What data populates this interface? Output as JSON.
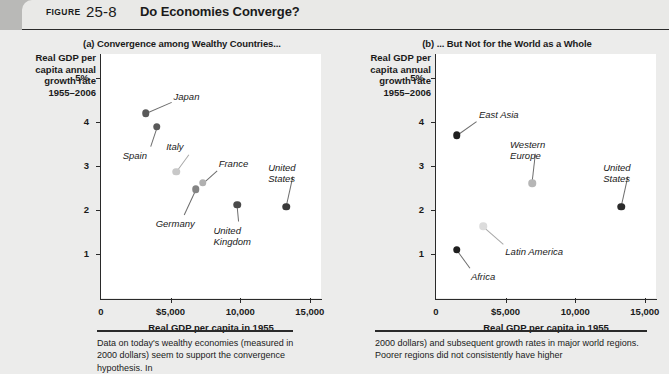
{
  "header": {
    "figure_tag": "FIGURE",
    "figure_number": "25-8",
    "title": "Do Economies Converge?"
  },
  "panels": {
    "a": {
      "subtitle": "(a) Convergence among Wealthy Countries...",
      "ylabel": "Real GDP per\ncapita annual\ngrowth rate\n1955–2006",
      "xlabel": "Real GDP per capita in 1955"
    },
    "b": {
      "subtitle": "(b) ... But Not for the World as a Whole",
      "ylabel": "Real GDP per\ncapita annual\ngrowth rate\n1955–2006",
      "xlabel": "Real GDP per capita in 1955"
    }
  },
  "axes": {
    "y_ticks": [
      "5%",
      "4",
      "3",
      "2",
      "1"
    ],
    "y_values": [
      5,
      4,
      3,
      2,
      1
    ],
    "x_ticks": [
      "0",
      "$5,000",
      "10,000",
      "15,000"
    ],
    "x_values": [
      0,
      5000,
      10000,
      15000
    ],
    "xlim": [
      0,
      15800
    ],
    "ylim": [
      0,
      5.55
    ]
  },
  "caption": {
    "left": "Data on today's wealthy economies (measured in 2000 dollars) seem to support the convergence hypothesis. In",
    "right": "2000 dollars) and subsequent growth rates in major world regions. Poorer regions did not consistently have higher"
  },
  "chart_data": [
    {
      "type": "scatter",
      "title": "(a) Convergence among Wealthy Countries...",
      "xlabel": "Real GDP per capita in 1955",
      "ylabel": "Real GDP per capita annual growth rate 1955–2006",
      "xlim": [
        0,
        15800
      ],
      "ylim": [
        0,
        5.55
      ],
      "grid": false,
      "legend": "none",
      "points": [
        {
          "label": "Japan",
          "x": 3200,
          "y": 4.2,
          "color": "#595959",
          "label_dx": 28,
          "label_dy": -22,
          "label_align": "left"
        },
        {
          "label": "Spain",
          "x": 4000,
          "y": 3.9,
          "color": "#595959",
          "label_dx": -34,
          "label_dy": 23,
          "label_align": "left"
        },
        {
          "label": "Italy",
          "x": 5400,
          "y": 2.87,
          "color": "#c8c8c8",
          "label_dx": -10,
          "label_dy": -31,
          "label_align": "left"
        },
        {
          "label": "Germany",
          "x": 6800,
          "y": 2.47,
          "color": "#848484",
          "label_dx": -40,
          "label_dy": 29,
          "label_align": "left"
        },
        {
          "label": "France",
          "x": 7300,
          "y": 2.62,
          "color": "#b0b0b0",
          "label_dx": 16,
          "label_dy": -25,
          "label_align": "left"
        },
        {
          "label": "United\nKingdom",
          "x": 9800,
          "y": 2.12,
          "color": "#4a4a4a",
          "label_dx": -24,
          "label_dy": 20,
          "label_align": "left"
        },
        {
          "label": "United\nStates",
          "x": 13300,
          "y": 2.07,
          "color": "#3a3a3a",
          "label_dx": -18,
          "label_dy": -45,
          "label_align": "left"
        }
      ]
    },
    {
      "type": "scatter",
      "title": "(b) ... But Not for the World as a Whole",
      "xlabel": "Real GDP per capita in 1955",
      "ylabel": "Real GDP per capita annual growth rate 1955–2006",
      "xlim": [
        0,
        15800
      ],
      "ylim": [
        0,
        5.55
      ],
      "grid": false,
      "legend": "none",
      "points": [
        {
          "label": "East Asia",
          "x": 1500,
          "y": 3.7,
          "color": "#1f1f1f",
          "label_dx": 22,
          "label_dy": -26,
          "label_align": "left"
        },
        {
          "label": "Africa",
          "x": 1500,
          "y": 1.1,
          "color": "#1f1f1f",
          "label_dx": 14,
          "label_dy": 21,
          "label_align": "left"
        },
        {
          "label": "Latin America",
          "x": 3400,
          "y": 1.63,
          "color": "#dcdcdc",
          "label_dx": 22,
          "label_dy": 20,
          "label_align": "left"
        },
        {
          "label": "Western\nEurope",
          "x": 6900,
          "y": 2.61,
          "color": "#b6b6b6",
          "label_dx": -22,
          "label_dy": -44,
          "label_align": "left"
        },
        {
          "label": "United\nStates",
          "x": 13300,
          "y": 2.07,
          "color": "#2b2b2b",
          "label_dx": -18,
          "label_dy": -45,
          "label_align": "left"
        }
      ]
    }
  ]
}
